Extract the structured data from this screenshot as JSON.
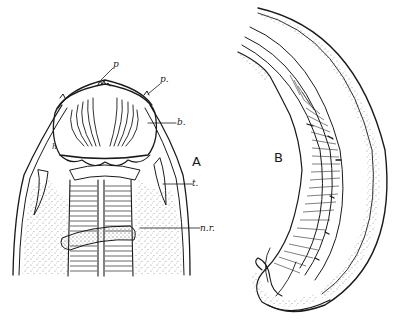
{
  "figure": {
    "panels": [
      {
        "id": "A",
        "label": "A",
        "subject": "anterior end (head) of nematode, ventral view"
      },
      {
        "id": "B",
        "label": "B",
        "subject": "posterior end (tail) of nematode, lateral view"
      }
    ],
    "annotations": [
      {
        "panel": "A",
        "label": "p",
        "target": "papilla (inner)"
      },
      {
        "panel": "A",
        "label": "p.",
        "target": "papilla (outer)"
      },
      {
        "panel": "A",
        "label": "b.",
        "target": "buccal capsule"
      },
      {
        "panel": "A",
        "label": "t.",
        "target": "tooth / lancet"
      },
      {
        "panel": "A",
        "label": "n.r.",
        "target": "nerve ring"
      },
      {
        "panel": "A",
        "label": "h",
        "target": "small mark left of capsule"
      }
    ]
  }
}
